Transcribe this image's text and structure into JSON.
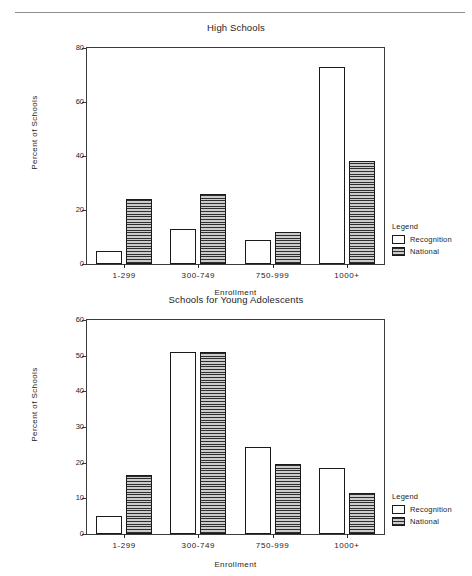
{
  "page": {
    "rule": "horizontal-rule"
  },
  "chart_data": [
    {
      "type": "bar",
      "id": "high-schools",
      "title": "High Schools",
      "xlabel": "Enrollment",
      "ylabel": "Percent of Schools",
      "categories": [
        "1-299",
        "300-749",
        "750-999",
        "1000+"
      ],
      "yticks": [
        0,
        20,
        40,
        60,
        80
      ],
      "ylim": [
        0,
        80
      ],
      "grid": false,
      "legend_title": "Legend",
      "legend_position": "right-bottom",
      "series": [
        {
          "name": "Recognition",
          "values": [
            5,
            13,
            9,
            73
          ],
          "fill": "white"
        },
        {
          "name": "National",
          "values": [
            24,
            26,
            12,
            38
          ],
          "fill": "hatched-gray"
        }
      ]
    },
    {
      "type": "bar",
      "id": "schools-for-young-adolescents",
      "title": "Schools for Young Adolescents",
      "xlabel": "Enrollment",
      "ylabel": "Percent of Schools",
      "categories": [
        "1-299",
        "300-749",
        "750-999",
        "1000+"
      ],
      "yticks": [
        0,
        10,
        20,
        30,
        40,
        50,
        60
      ],
      "ylim": [
        0,
        60
      ],
      "grid": false,
      "legend_title": "Legend",
      "legend_position": "right-bottom",
      "series": [
        {
          "name": "Recognition",
          "values": [
            5,
            51,
            24.5,
            18.5
          ],
          "fill": "white"
        },
        {
          "name": "National",
          "values": [
            16.5,
            51,
            19.5,
            11.5
          ],
          "fill": "hatched-gray"
        }
      ]
    }
  ],
  "colors": {
    "frame": "#3b3b3b",
    "bar_border": "#1a1a1a",
    "national_fill": "#8a8a8a",
    "recognition_fill": "#ffffff",
    "text": "#1d1d1d",
    "rule": "#8d8d8d"
  }
}
